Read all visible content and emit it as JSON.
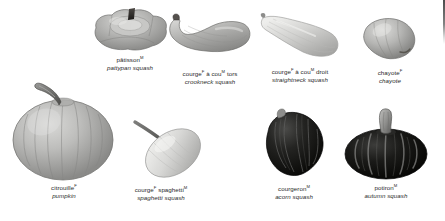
{
  "plate": {
    "title": "Squash varieties",
    "background_color": "#ffffff",
    "text_color": "#2a2a2a"
  },
  "specimens": [
    {
      "id": "pattypan-squash",
      "icon": "pattypan-squash-illustration",
      "term": "pâtisson",
      "gender": "M",
      "gloss": "pattypan squash",
      "row": "top"
    },
    {
      "id": "crookneck-squash",
      "icon": "crookneck-squash-illustration",
      "term_parts": [
        "courge",
        "F",
        " à cou",
        "M",
        " tors"
      ],
      "term": "courge à cou tors",
      "gloss": "crookneck squash",
      "row": "top"
    },
    {
      "id": "straightneck-squash",
      "icon": "straightneck-squash-illustration",
      "term_parts": [
        "courge",
        "F",
        " à cou",
        "M",
        " droit"
      ],
      "term": "courge à cou droit",
      "gloss": "straightneck squash",
      "row": "top"
    },
    {
      "id": "chayote",
      "icon": "chayote-illustration",
      "term": "chayote",
      "gender": "F",
      "gloss": "chayote",
      "row": "top"
    },
    {
      "id": "pumpkin",
      "icon": "pumpkin-illustration",
      "term": "citrouille",
      "gender": "F",
      "gloss": "pumpkin",
      "row": "bottom"
    },
    {
      "id": "spaghetti-squash",
      "icon": "spaghetti-squash-illustration",
      "term_parts": [
        "courge",
        "F",
        " spaghetti",
        "M"
      ],
      "term": "courge spaghetti",
      "gloss": "spaghetti squash",
      "row": "bottom"
    },
    {
      "id": "acorn-squash",
      "icon": "acorn-squash-illustration",
      "term": "courgeron",
      "gender": "M",
      "gloss": "acorn squash",
      "row": "bottom"
    },
    {
      "id": "autumn-squash",
      "icon": "autumn-squash-illustration",
      "term": "potiron",
      "gender": "M",
      "gloss": "autumn squash",
      "row": "bottom"
    }
  ]
}
